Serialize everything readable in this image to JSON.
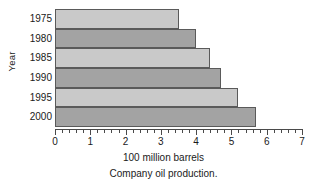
{
  "chart_data": {
    "type": "bar",
    "orientation": "horizontal",
    "title": "",
    "caption": "Company oil production.",
    "xlabel": "100 million barrels",
    "ylabel": "Year",
    "categories": [
      "1975",
      "1980",
      "1985",
      "1990",
      "1995",
      "2000"
    ],
    "values": [
      3.5,
      4.0,
      4.4,
      4.7,
      5.2,
      5.7
    ],
    "xlim": [
      0,
      7
    ],
    "xticks": [
      0,
      1,
      2,
      3,
      4,
      5,
      6,
      7
    ],
    "xtick_labels": [
      "0",
      "1",
      "2",
      "3",
      "4",
      "5",
      "6",
      "7"
    ],
    "minor_ticks_per_unit": 5,
    "grid": false,
    "legend": "none",
    "series": [
      {
        "name": "Company oil production",
        "values": [
          3.5,
          4.0,
          4.4,
          4.7,
          5.2,
          5.7
        ]
      }
    ],
    "bar_colors": [
      "#c9c9c9",
      "#a3a3a3",
      "#c9c9c9",
      "#a3a3a3",
      "#c9c9c9",
      "#a3a3a3"
    ],
    "bar_border_color": "#5a5a5a",
    "axis_color": "#4a4a4a",
    "background_color": "#ffffff"
  }
}
